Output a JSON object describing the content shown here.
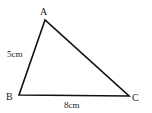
{
  "diagram": {
    "type": "triangle",
    "stroke_color": "#111111",
    "vertices": [
      {
        "label": "A",
        "x": 45,
        "y": 20
      },
      {
        "label": "B",
        "x": 19,
        "y": 95
      },
      {
        "label": "C",
        "x": 129,
        "y": 96
      }
    ],
    "sides": [
      {
        "from": "A",
        "to": "B",
        "label": "5cm"
      },
      {
        "from": "B",
        "to": "C",
        "label": "8cm"
      },
      {
        "from": "A",
        "to": "C",
        "label": ""
      }
    ]
  },
  "labels": {
    "a": "A",
    "b": "B",
    "c": "C",
    "ab_length": "5cm",
    "bc_length": "8cm"
  }
}
